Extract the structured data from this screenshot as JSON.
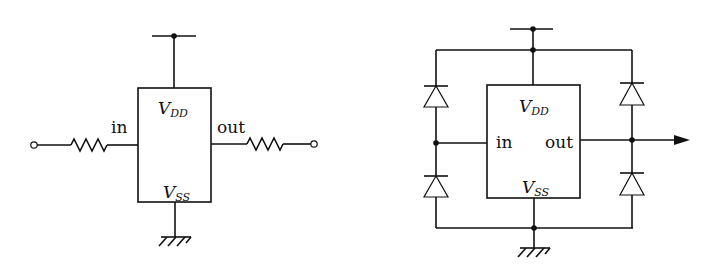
{
  "diagrams": [
    {
      "id": "series-resistor-protection",
      "labels": {
        "vdd_main": "V",
        "vdd_sub": "DD",
        "vss_main": "V",
        "vss_sub": "SS",
        "input": "in",
        "output": "out"
      },
      "components": [
        "input-terminal",
        "input-resistor",
        "ic-block",
        "output-resistor",
        "output-terminal",
        "vdd-supply",
        "ground"
      ]
    },
    {
      "id": "diode-clamp-protection",
      "labels": {
        "vdd_main": "V",
        "vdd_sub": "DD",
        "vss_main": "V",
        "vss_sub": "SS",
        "input": "in",
        "output": "out"
      },
      "components": [
        "ic-block",
        "input-clamp-diode-upper",
        "input-clamp-diode-lower",
        "output-clamp-diode-upper",
        "output-clamp-diode-lower",
        "vdd-supply",
        "ground",
        "output-arrow"
      ]
    }
  ]
}
